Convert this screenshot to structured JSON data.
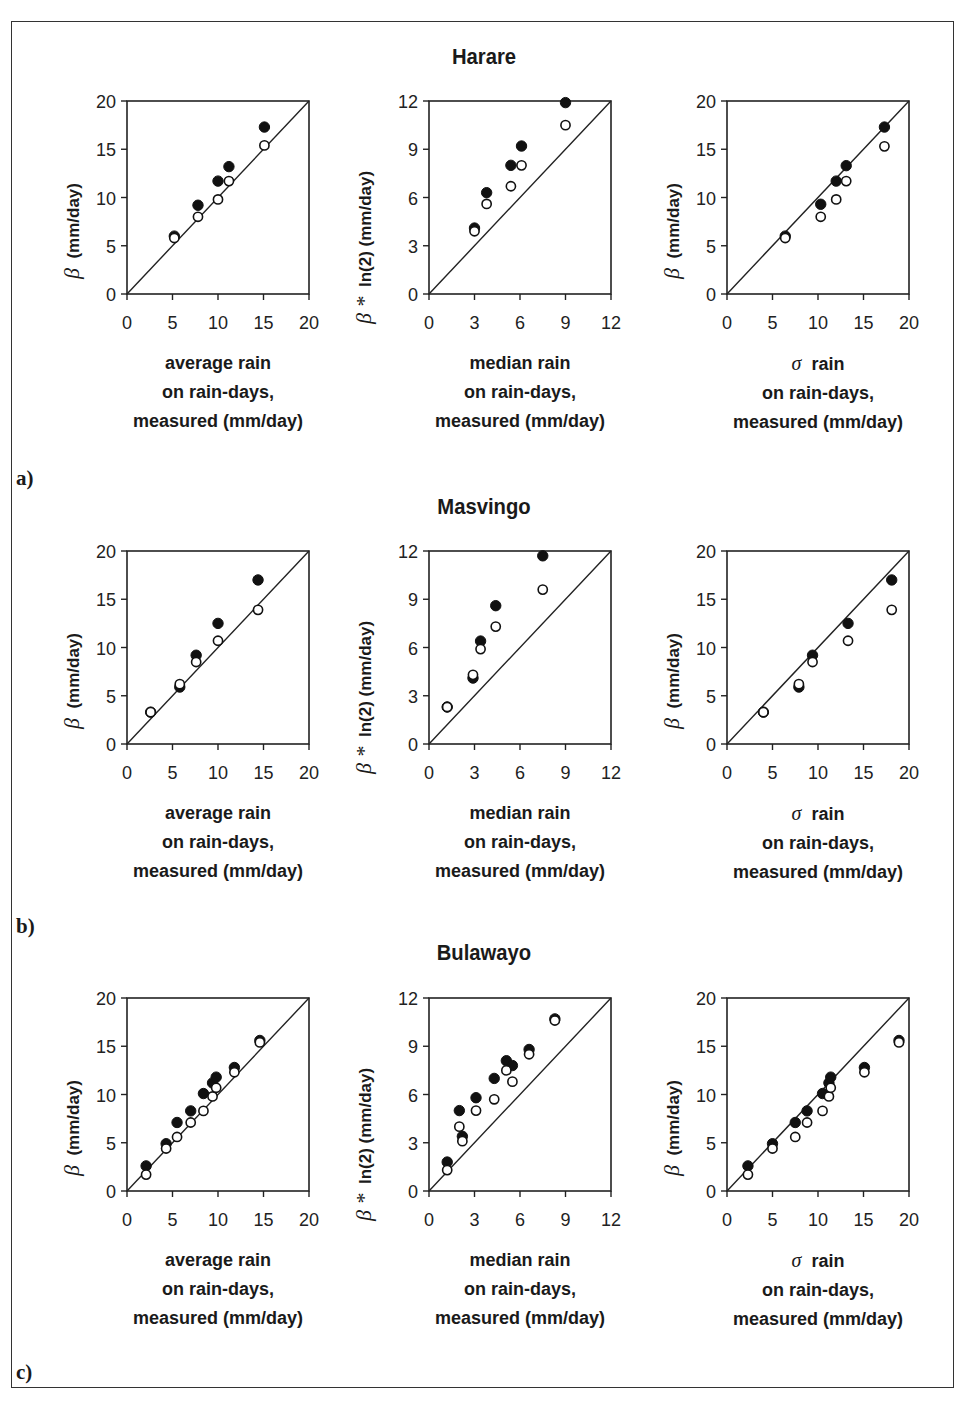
{
  "figure": {
    "panels": [
      {
        "label": "a)",
        "site": "Harare"
      },
      {
        "label": "b)",
        "site": "Masvingo"
      },
      {
        "label": "c)",
        "site": "Bulawayo"
      }
    ],
    "xlabels": {
      "mean": [
        "average rain",
        "on rain-days,",
        "measured (mm/day)"
      ],
      "median": [
        "median rain",
        "on rain-days,",
        "measured (mm/day)"
      ],
      "sigma": [
        "rain",
        "on rain-days,",
        "measured (mm/day)"
      ]
    },
    "xlabel_sigma_symbol": "σ",
    "ylabels": {
      "mean": {
        "symbol": "β",
        "text": "(mm/day)"
      },
      "median": {
        "symbol": "β *",
        "text": "ln(2) (mm/day)"
      },
      "sigma": {
        "symbol": "β",
        "text": "(mm/day)"
      }
    },
    "marker_legend": {
      "filled": "filled circles",
      "open": "open circles"
    }
  },
  "chart_data": [
    {
      "type": "scatter",
      "panel": "a)",
      "title": "Harare",
      "xlabel": "average rain on rain-days, measured (mm/day)",
      "ylabel": "β (mm/day)",
      "xlim": [
        0,
        20
      ],
      "ylim": [
        0,
        20
      ],
      "xticks": [
        0,
        5,
        10,
        15,
        20
      ],
      "yticks": [
        0,
        5,
        10,
        15,
        20
      ],
      "reference_line": "1:1",
      "series": [
        {
          "name": "filled",
          "points": [
            [
              5.2,
              6.0
            ],
            [
              7.8,
              9.2
            ],
            [
              10.0,
              11.7
            ],
            [
              11.2,
              13.2
            ],
            [
              15.1,
              17.3
            ]
          ]
        },
        {
          "name": "open",
          "points": [
            [
              5.2,
              5.8
            ],
            [
              7.8,
              8.0
            ],
            [
              10.0,
              9.8
            ],
            [
              11.2,
              11.7
            ],
            [
              15.1,
              15.4
            ]
          ]
        }
      ]
    },
    {
      "type": "scatter",
      "panel": "a)",
      "title": "Harare",
      "xlabel": "median rain on rain-days, measured (mm/day)",
      "ylabel": "β * ln(2) (mm/day)",
      "xlim": [
        0,
        12
      ],
      "ylim": [
        0,
        12
      ],
      "xticks": [
        0,
        3,
        6,
        9,
        12
      ],
      "yticks": [
        0,
        3,
        6,
        9,
        12
      ],
      "reference_line": "1:1",
      "series": [
        {
          "name": "filled",
          "points": [
            [
              3.0,
              4.1
            ],
            [
              3.8,
              6.3
            ],
            [
              5.4,
              8.0
            ],
            [
              6.1,
              9.2
            ],
            [
              9.0,
              11.9
            ]
          ]
        },
        {
          "name": "open",
          "points": [
            [
              3.0,
              3.9
            ],
            [
              3.8,
              5.6
            ],
            [
              5.4,
              6.7
            ],
            [
              6.1,
              8.0
            ],
            [
              9.0,
              10.5
            ]
          ]
        }
      ]
    },
    {
      "type": "scatter",
      "panel": "a)",
      "title": "Harare",
      "xlabel": "σ rain on rain-days, measured (mm/day)",
      "ylabel": "β (mm/day)",
      "xlim": [
        0,
        20
      ],
      "ylim": [
        0,
        20
      ],
      "xticks": [
        0,
        5,
        10,
        15,
        20
      ],
      "yticks": [
        0,
        5,
        10,
        15,
        20
      ],
      "reference_line": "1:1",
      "series": [
        {
          "name": "filled",
          "points": [
            [
              6.4,
              6.0
            ],
            [
              10.3,
              9.3
            ],
            [
              12.0,
              11.7
            ],
            [
              13.1,
              13.3
            ],
            [
              17.3,
              17.3
            ]
          ]
        },
        {
          "name": "open",
          "points": [
            [
              6.4,
              5.8
            ],
            [
              10.3,
              8.0
            ],
            [
              12.0,
              9.8
            ],
            [
              13.1,
              11.7
            ],
            [
              17.3,
              15.3
            ]
          ]
        }
      ]
    },
    {
      "type": "scatter",
      "panel": "b)",
      "title": "Masvingo",
      "xlabel": "average rain on rain-days, measured (mm/day)",
      "ylabel": "β (mm/day)",
      "xlim": [
        0,
        20
      ],
      "ylim": [
        0,
        20
      ],
      "xticks": [
        0,
        5,
        10,
        15,
        20
      ],
      "yticks": [
        0,
        5,
        10,
        15,
        20
      ],
      "reference_line": "1:1",
      "series": [
        {
          "name": "filled",
          "points": [
            [
              2.6,
              3.3
            ],
            [
              5.8,
              5.9
            ],
            [
              7.6,
              9.2
            ],
            [
              10.0,
              12.5
            ],
            [
              14.4,
              17.0
            ]
          ]
        },
        {
          "name": "open",
          "points": [
            [
              2.6,
              3.3
            ],
            [
              5.8,
              6.2
            ],
            [
              7.6,
              8.5
            ],
            [
              10.0,
              10.7
            ],
            [
              14.4,
              13.9
            ]
          ]
        }
      ]
    },
    {
      "type": "scatter",
      "panel": "b)",
      "title": "Masvingo",
      "xlabel": "median rain on rain-days, measured (mm/day)",
      "ylabel": "β * ln(2) (mm/day)",
      "xlim": [
        0,
        12
      ],
      "ylim": [
        0,
        12
      ],
      "xticks": [
        0,
        3,
        6,
        9,
        12
      ],
      "yticks": [
        0,
        3,
        6,
        9,
        12
      ],
      "reference_line": "1:1",
      "series": [
        {
          "name": "filled",
          "points": [
            [
              1.2,
              2.3
            ],
            [
              2.9,
              4.1
            ],
            [
              3.4,
              6.4
            ],
            [
              4.4,
              8.6
            ],
            [
              7.5,
              11.7
            ]
          ]
        },
        {
          "name": "open",
          "points": [
            [
              1.2,
              2.3
            ],
            [
              2.9,
              4.3
            ],
            [
              3.4,
              5.9
            ],
            [
              4.4,
              7.3
            ],
            [
              7.5,
              9.6
            ]
          ]
        }
      ]
    },
    {
      "type": "scatter",
      "panel": "b)",
      "title": "Masvingo",
      "xlabel": "σ rain on rain-days, measured (mm/day)",
      "ylabel": "β (mm/day)",
      "xlim": [
        0,
        20
      ],
      "ylim": [
        0,
        20
      ],
      "xticks": [
        0,
        5,
        10,
        15,
        20
      ],
      "yticks": [
        0,
        5,
        10,
        15,
        20
      ],
      "reference_line": "1:1",
      "series": [
        {
          "name": "filled",
          "points": [
            [
              4.0,
              3.3
            ],
            [
              7.9,
              5.9
            ],
            [
              9.4,
              9.2
            ],
            [
              13.3,
              12.5
            ],
            [
              18.1,
              17.0
            ]
          ]
        },
        {
          "name": "open",
          "points": [
            [
              4.0,
              3.3
            ],
            [
              7.9,
              6.2
            ],
            [
              9.4,
              8.5
            ],
            [
              13.3,
              10.7
            ],
            [
              18.1,
              13.9
            ]
          ]
        }
      ]
    },
    {
      "type": "scatter",
      "panel": "c)",
      "title": "Bulawayo",
      "xlabel": "average rain on rain-days, measured (mm/day)",
      "ylabel": "β (mm/day)",
      "xlim": [
        0,
        20
      ],
      "ylim": [
        0,
        20
      ],
      "xticks": [
        0,
        5,
        10,
        15,
        20
      ],
      "yticks": [
        0,
        5,
        10,
        15,
        20
      ],
      "reference_line": "1:1",
      "series": [
        {
          "name": "filled",
          "points": [
            [
              2.1,
              2.6
            ],
            [
              4.3,
              4.9
            ],
            [
              5.5,
              7.1
            ],
            [
              7.0,
              8.3
            ],
            [
              8.4,
              10.1
            ],
            [
              9.4,
              11.2
            ],
            [
              9.8,
              11.8
            ],
            [
              11.8,
              12.8
            ],
            [
              14.6,
              15.6
            ]
          ]
        },
        {
          "name": "open",
          "points": [
            [
              2.1,
              1.7
            ],
            [
              4.3,
              4.4
            ],
            [
              5.5,
              5.6
            ],
            [
              7.0,
              7.1
            ],
            [
              8.4,
              8.3
            ],
            [
              9.4,
              9.8
            ],
            [
              9.8,
              10.7
            ],
            [
              11.8,
              12.3
            ],
            [
              14.6,
              15.4
            ]
          ]
        }
      ]
    },
    {
      "type": "scatter",
      "panel": "c)",
      "title": "Bulawayo",
      "xlabel": "median rain on rain-days, measured (mm/day)",
      "ylabel": "β * ln(2) (mm/day)",
      "xlim": [
        0,
        12
      ],
      "ylim": [
        0,
        12
      ],
      "xticks": [
        0,
        3,
        6,
        9,
        12
      ],
      "yticks": [
        0,
        3,
        6,
        9,
        12
      ],
      "reference_line": "1:1",
      "series": [
        {
          "name": "filled",
          "points": [
            [
              1.2,
              1.8
            ],
            [
              2.0,
              5.0
            ],
            [
              2.2,
              3.4
            ],
            [
              3.1,
              5.8
            ],
            [
              4.3,
              7.0
            ],
            [
              5.1,
              8.1
            ],
            [
              5.5,
              7.8
            ],
            [
              6.6,
              8.8
            ],
            [
              8.3,
              10.7
            ]
          ]
        },
        {
          "name": "open",
          "points": [
            [
              1.2,
              1.3
            ],
            [
              2.0,
              4.0
            ],
            [
              2.2,
              3.1
            ],
            [
              3.1,
              5.0
            ],
            [
              4.3,
              5.7
            ],
            [
              5.1,
              7.5
            ],
            [
              5.5,
              6.8
            ],
            [
              6.6,
              8.5
            ],
            [
              8.3,
              10.6
            ]
          ]
        }
      ]
    },
    {
      "type": "scatter",
      "panel": "c)",
      "title": "Bulawayo",
      "xlabel": "σ rain on rain-days, measured (mm/day)",
      "ylabel": "β (mm/day)",
      "xlim": [
        0,
        20
      ],
      "ylim": [
        0,
        20
      ],
      "xticks": [
        0,
        5,
        10,
        15,
        20
      ],
      "yticks": [
        0,
        5,
        10,
        15,
        20
      ],
      "reference_line": "1:1",
      "series": [
        {
          "name": "filled",
          "points": [
            [
              2.3,
              2.6
            ],
            [
              5.0,
              4.9
            ],
            [
              7.5,
              7.1
            ],
            [
              8.8,
              8.3
            ],
            [
              10.5,
              10.1
            ],
            [
              11.2,
              11.2
            ],
            [
              11.4,
              11.8
            ],
            [
              15.1,
              12.8
            ],
            [
              18.9,
              15.6
            ]
          ]
        },
        {
          "name": "open",
          "points": [
            [
              2.3,
              1.7
            ],
            [
              5.0,
              4.4
            ],
            [
              7.5,
              5.6
            ],
            [
              8.8,
              7.1
            ],
            [
              10.5,
              8.3
            ],
            [
              11.2,
              9.8
            ],
            [
              11.4,
              10.7
            ],
            [
              15.1,
              12.3
            ],
            [
              18.9,
              15.4
            ]
          ]
        }
      ]
    }
  ]
}
